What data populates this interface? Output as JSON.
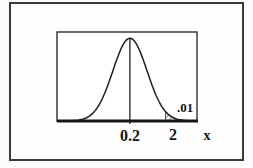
{
  "figure": {
    "background": "#fcfcfc",
    "ink_color": "#1f1f1f",
    "frame_color": "#3a3a3a"
  },
  "chart_data": {
    "type": "area",
    "title": "",
    "xlabel": "x",
    "x_tick_labels": [
      "0.2",
      "2"
    ],
    "mean_tick_label": "0.2",
    "critical_tick_label": "2",
    "axis_label": "x",
    "tail_area_label": ".01",
    "tail_area_value": 0.01,
    "grid": false,
    "legend": false,
    "curve": {
      "shape": "gaussian",
      "mu_frac": 0.521,
      "sigma_frac": 0.122,
      "peak_frac": 0.93,
      "tail_start_frac": 0.775
    }
  }
}
